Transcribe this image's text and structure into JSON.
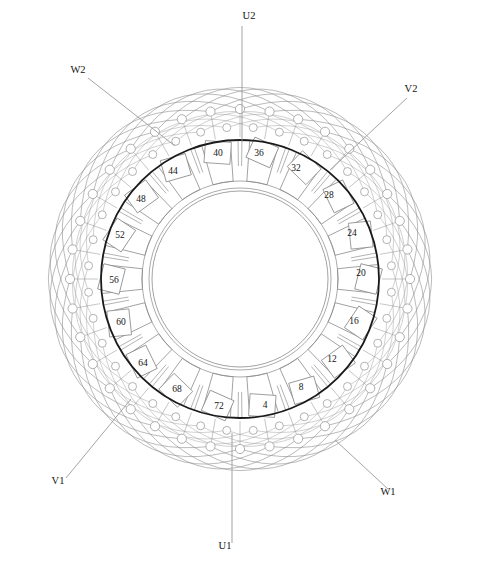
{
  "diagram": {
    "type": "winding-diagram",
    "slot_count": 72,
    "background_color": "#ffffff",
    "bore_circle": {
      "center_x": 240,
      "center_y": 279,
      "radius": 139,
      "color": "#1a1a1a",
      "stroke_width": 1.8
    },
    "colors": {
      "bore_line": "#1a1a1a",
      "core_line": "#8a8a8a",
      "overhang_arc": "#909090",
      "conductor_circle": "#a0a0a0",
      "leader_line": "#9a9a9a",
      "text": "#141414"
    },
    "geometry": {
      "teeth_count": 18,
      "coil_groups": 18,
      "conductor_ring_outer_radius": 170,
      "conductor_ring_inner_radius": 152,
      "conductors_per_ring": 36,
      "overhang_arc_count": 36,
      "inner_ring_radius": 88,
      "inner_band_radius": 98
    }
  },
  "slot_labels": [
    {
      "name": "slot-4",
      "text": "4",
      "x": 265,
      "y": 408,
      "angle_deg": 82.5
    },
    {
      "name": "slot-8",
      "text": "8",
      "x": 301,
      "y": 390,
      "angle_deg": 62.5
    },
    {
      "name": "slot-12",
      "text": "12",
      "x": 332,
      "y": 362,
      "angle_deg": 42.5
    },
    {
      "name": "slot-16",
      "text": "16",
      "x": 354,
      "y": 324,
      "angle_deg": 22.5
    },
    {
      "name": "slot-20",
      "text": "20",
      "x": 361,
      "y": 276,
      "angle_deg": 2.5
    },
    {
      "name": "slot-24",
      "text": "24",
      "x": 352,
      "y": 236,
      "angle_deg": -17.5
    },
    {
      "name": "slot-28",
      "text": "28",
      "x": 329,
      "y": 198,
      "angle_deg": -37.5
    },
    {
      "name": "slot-32",
      "text": "32",
      "x": 296,
      "y": 171,
      "angle_deg": -57.5
    },
    {
      "name": "slot-36",
      "text": "36",
      "x": 259,
      "y": 156,
      "angle_deg": -77.5
    },
    {
      "name": "slot-40",
      "text": "40",
      "x": 218,
      "y": 156,
      "angle_deg": -97.5
    },
    {
      "name": "slot-44",
      "text": "44",
      "x": 173,
      "y": 174,
      "angle_deg": -117.5
    },
    {
      "name": "slot-48",
      "text": "48",
      "x": 141,
      "y": 202,
      "angle_deg": -137.5
    },
    {
      "name": "slot-52",
      "text": "52",
      "x": 120,
      "y": 238,
      "angle_deg": -157.5
    },
    {
      "name": "slot-56",
      "text": "56",
      "x": 114,
      "y": 283,
      "angle_deg": -177.5
    },
    {
      "name": "slot-60",
      "text": "60",
      "x": 121,
      "y": 325,
      "angle_deg": 162.5
    },
    {
      "name": "slot-64",
      "text": "64",
      "x": 143,
      "y": 366,
      "angle_deg": 142.5
    },
    {
      "name": "slot-68",
      "text": "68",
      "x": 177,
      "y": 392,
      "angle_deg": 122.5
    },
    {
      "name": "slot-72",
      "text": "72",
      "x": 219,
      "y": 409,
      "angle_deg": 102.5
    }
  ],
  "terminals": [
    {
      "name": "terminal-u2",
      "text": "U2",
      "label_x": 249,
      "label_y": 19,
      "leader": {
        "x1": 242,
        "y1": 26,
        "x2": 242,
        "y2": 142
      }
    },
    {
      "name": "terminal-v2",
      "text": "V2",
      "label_x": 411,
      "label_y": 92,
      "leader": {
        "x1": 407,
        "y1": 98,
        "x2": 330,
        "y2": 170
      }
    },
    {
      "name": "terminal-w1",
      "text": "W1",
      "label_x": 388,
      "label_y": 495,
      "leader": {
        "x1": 388,
        "y1": 489,
        "x2": 335,
        "y2": 440
      }
    },
    {
      "name": "terminal-u1",
      "text": "U1",
      "label_x": 225,
      "label_y": 549,
      "leader": {
        "x1": 232,
        "y1": 543,
        "x2": 232,
        "y2": 433
      }
    },
    {
      "name": "terminal-v1",
      "text": "V1",
      "label_x": 58,
      "label_y": 484,
      "leader": {
        "x1": 66,
        "y1": 478,
        "x2": 131,
        "y2": 399
      }
    },
    {
      "name": "terminal-w2",
      "text": "W2",
      "label_x": 78,
      "label_y": 73,
      "leader": {
        "x1": 88,
        "y1": 78,
        "x2": 175,
        "y2": 146
      }
    }
  ]
}
